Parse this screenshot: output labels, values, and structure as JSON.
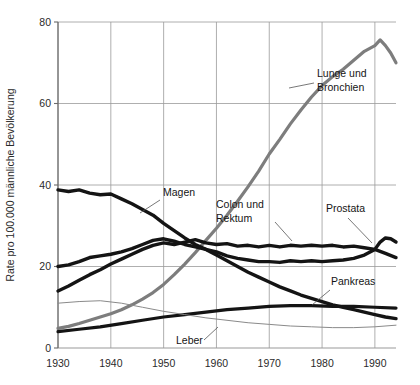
{
  "chart_data": {
    "type": "line",
    "title": "",
    "xlabel": "",
    "ylabel": "Rate pro 100.000 männliche Bevölkerung",
    "xlim": [
      1930,
      1994
    ],
    "ylim": [
      0,
      80
    ],
    "xticks": [
      "1930",
      "1940",
      "1950",
      "1960",
      "1970",
      "1980",
      "1990"
    ],
    "yticks": [
      "0",
      "20",
      "40",
      "60",
      "80"
    ],
    "grid": true,
    "legend": "inline-annotations",
    "series": [
      {
        "name": "Lunge und Bronchien",
        "label": "Lunge und Bronchien",
        "color": "#7d7d7d",
        "width": 3.2,
        "x": [
          1930,
          1932,
          1934,
          1936,
          1938,
          1940,
          1942,
          1944,
          1946,
          1948,
          1950,
          1952,
          1954,
          1956,
          1958,
          1960,
          1962,
          1964,
          1966,
          1968,
          1970,
          1972,
          1974,
          1976,
          1978,
          1980,
          1982,
          1984,
          1986,
          1988,
          1990,
          1991,
          1992,
          1993,
          1994
        ],
        "values": [
          4.8,
          5.3,
          6.0,
          6.8,
          7.6,
          8.4,
          9.4,
          10.6,
          12.0,
          13.6,
          15.6,
          18.0,
          20.6,
          23.4,
          26.4,
          29.4,
          32.6,
          36.0,
          39.6,
          43.4,
          47.6,
          51.2,
          55.0,
          58.4,
          61.6,
          64.4,
          66.6,
          68.4,
          70.6,
          72.8,
          74.2,
          75.6,
          74.2,
          72.4,
          70.0
        ]
      },
      {
        "name": "Magen",
        "label": "Magen",
        "color": "#141414",
        "width": 3.4,
        "x": [
          1930,
          1932,
          1934,
          1936,
          1938,
          1940,
          1942,
          1944,
          1946,
          1948,
          1950,
          1952,
          1954,
          1956,
          1958,
          1960,
          1962,
          1964,
          1966,
          1968,
          1970,
          1972,
          1974,
          1976,
          1978,
          1980,
          1982,
          1984,
          1986,
          1988,
          1990,
          1992,
          1994
        ],
        "values": [
          38.8,
          38.4,
          38.8,
          38.0,
          37.6,
          37.8,
          36.6,
          35.4,
          34.0,
          32.6,
          30.6,
          28.8,
          27.0,
          25.4,
          24.2,
          22.8,
          21.4,
          20.0,
          18.6,
          17.4,
          16.2,
          15.0,
          14.0,
          13.0,
          12.2,
          11.4,
          10.6,
          10.0,
          9.4,
          8.8,
          8.2,
          7.6,
          7.2
        ]
      },
      {
        "name": "Colon und Rektum",
        "label": "Colon und Rektum",
        "color": "#141414",
        "width": 3.4,
        "x": [
          1930,
          1932,
          1934,
          1936,
          1938,
          1940,
          1942,
          1944,
          1946,
          1948,
          1950,
          1952,
          1954,
          1956,
          1958,
          1960,
          1962,
          1964,
          1966,
          1968,
          1970,
          1972,
          1974,
          1976,
          1978,
          1980,
          1982,
          1984,
          1986,
          1988,
          1990,
          1992,
          1994
        ],
        "values": [
          14.0,
          15.2,
          16.6,
          18.0,
          19.2,
          20.6,
          21.8,
          23.0,
          24.2,
          25.2,
          25.8,
          25.4,
          26.0,
          26.6,
          25.8,
          25.4,
          25.6,
          25.0,
          25.2,
          24.8,
          25.2,
          24.8,
          25.2,
          25.0,
          25.2,
          25.0,
          25.2,
          24.8,
          25.0,
          24.6,
          24.2,
          23.2,
          22.2
        ]
      },
      {
        "name": "Prostata",
        "label": "Prostata",
        "color": "#141414",
        "width": 3.4,
        "x": [
          1930,
          1932,
          1934,
          1936,
          1938,
          1940,
          1942,
          1944,
          1946,
          1948,
          1950,
          1952,
          1954,
          1956,
          1958,
          1960,
          1962,
          1964,
          1966,
          1968,
          1970,
          1972,
          1974,
          1976,
          1978,
          1980,
          1982,
          1984,
          1986,
          1988,
          1990,
          1991,
          1992,
          1993,
          1994
        ],
        "values": [
          20.0,
          20.4,
          21.2,
          22.2,
          22.6,
          23.0,
          23.6,
          24.4,
          25.4,
          26.4,
          26.8,
          26.2,
          25.4,
          24.8,
          24.2,
          23.6,
          22.6,
          22.0,
          21.6,
          21.2,
          21.2,
          21.0,
          21.4,
          21.2,
          21.4,
          21.2,
          21.4,
          21.6,
          22.0,
          22.8,
          24.2,
          26.0,
          27.0,
          26.8,
          26.0
        ]
      },
      {
        "name": "Pankreas",
        "label": "Pankreas",
        "color": "#141414",
        "width": 3.2,
        "x": [
          1930,
          1934,
          1938,
          1942,
          1946,
          1950,
          1954,
          1958,
          1962,
          1966,
          1970,
          1974,
          1978,
          1982,
          1986,
          1990,
          1994
        ],
        "values": [
          4.0,
          4.6,
          5.2,
          6.0,
          6.8,
          7.6,
          8.2,
          8.8,
          9.4,
          9.8,
          10.2,
          10.4,
          10.4,
          10.2,
          10.2,
          10.0,
          9.8
        ]
      },
      {
        "name": "Leber",
        "label": "Leber",
        "color": "#8a8a8a",
        "width": 1.0,
        "x": [
          1930,
          1934,
          1938,
          1942,
          1946,
          1950,
          1954,
          1958,
          1962,
          1966,
          1970,
          1974,
          1978,
          1982,
          1986,
          1990,
          1994
        ],
        "values": [
          11.0,
          11.4,
          11.6,
          11.0,
          10.0,
          9.0,
          8.2,
          7.4,
          6.8,
          6.2,
          5.8,
          5.4,
          5.2,
          5.0,
          5.0,
          5.2,
          5.6
        ]
      }
    ],
    "annotations": [
      {
        "text": "Magen",
        "x": 163,
        "y": 196,
        "anchor": "start",
        "leader": [
          [
            160,
            200
          ],
          [
            140,
            213
          ]
        ]
      },
      {
        "text": "Lunge und",
        "x": 317,
        "y": 77,
        "anchor": "start",
        "leader": [
          [
            314,
            83
          ],
          [
            289,
            88
          ]
        ]
      },
      {
        "text": "Bronchien",
        "x": 317,
        "y": 91,
        "anchor": "start",
        "leader": null
      },
      {
        "text": "Colon und",
        "x": 216,
        "y": 208,
        "anchor": "start",
        "leader": [
          [
            275,
            222
          ],
          [
            292,
            241
          ]
        ]
      },
      {
        "text": "Rektum",
        "x": 216,
        "y": 222,
        "anchor": "start",
        "leader": null
      },
      {
        "text": "Prostata",
        "x": 326,
        "y": 212,
        "anchor": "start",
        "leader": [
          [
            348,
            218
          ],
          [
            372,
            243
          ]
        ]
      },
      {
        "text": "Pankreas",
        "x": 331,
        "y": 285,
        "anchor": "start",
        "leader": [
          [
            330,
            290
          ],
          [
            312,
            305
          ]
        ]
      },
      {
        "text": "Leber",
        "x": 176,
        "y": 344,
        "anchor": "start",
        "leader": [
          [
            204,
            340
          ],
          [
            218,
            327
          ]
        ]
      }
    ]
  },
  "axis": {
    "y_title": "Rate pro 100.000 männliche Bevölkerung"
  }
}
